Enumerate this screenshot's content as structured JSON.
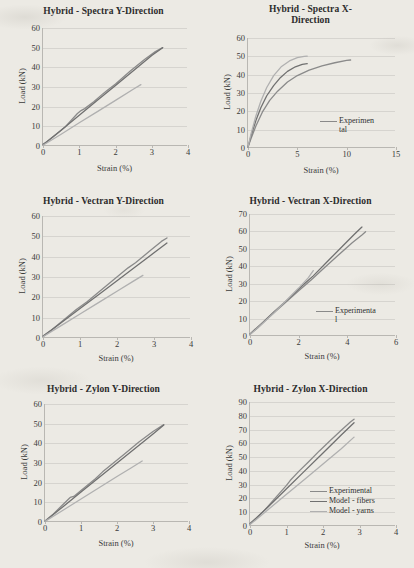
{
  "figure": {
    "background_color": "#eceae4",
    "series_colors": {
      "experimental": "#8a8a8a",
      "model_fibers": "#707070",
      "model_yarns": "#b0b0b0"
    }
  },
  "chart_data": [
    {
      "id": "spectra-y",
      "type": "line",
      "title": "Hybrid - Spectra Y-Direction",
      "xlabel": "Strain (%)",
      "ylabel": "Load (kN)",
      "xlim": [
        0,
        4
      ],
      "ylim": [
        0,
        60
      ],
      "xticks": [
        0,
        1,
        2,
        3,
        4
      ],
      "yticks": [
        0,
        10,
        20,
        30,
        40,
        50,
        60
      ],
      "grid": true,
      "legend": null,
      "series": [
        {
          "name": "Experimental",
          "color": "#8a8a8a",
          "x": [
            0,
            0.1,
            0.3,
            0.6,
            0.95,
            1.05,
            1.15,
            1.4,
            1.65,
            1.75,
            2.0,
            2.4,
            2.8,
            3.1,
            3.3
          ],
          "y": [
            1.0,
            2.0,
            5.0,
            9.5,
            16.5,
            18.0,
            19.0,
            22.5,
            26.5,
            28.0,
            31.5,
            38.0,
            44.0,
            48.0,
            50.0
          ]
        },
        {
          "name": "Model - fibers",
          "color": "#707070",
          "x": [
            0,
            0.5,
            1.0,
            1.5,
            2.0,
            2.5,
            3.0,
            3.3
          ],
          "y": [
            0.6,
            8.0,
            15.6,
            23.2,
            30.8,
            38.4,
            46.0,
            50.0
          ]
        },
        {
          "name": "Model - yarns",
          "color": "#b0b0b0",
          "x": [
            0,
            0.5,
            1.0,
            1.5,
            2.0,
            2.5,
            2.7
          ],
          "y": [
            0.4,
            6.0,
            11.8,
            17.5,
            23.2,
            29.0,
            31.2
          ]
        }
      ]
    },
    {
      "id": "spectra-x",
      "type": "line",
      "title_lines": [
        "Hybrid - Spectra X-",
        "Direction"
      ],
      "title": "Hybrid - Spectra X-Direction",
      "xlabel": "Strain (%)",
      "ylabel": "Load (kN)",
      "xlim": [
        0,
        15
      ],
      "ylim": [
        0,
        60
      ],
      "xticks": [
        0,
        5,
        10,
        15
      ],
      "yticks": [
        0,
        10,
        20,
        30,
        40,
        50,
        60
      ],
      "grid": true,
      "legend": {
        "position": "inside-lower-right",
        "entries": [
          {
            "label": "Experimental",
            "label_lines": [
              "Experimen",
              "tal"
            ],
            "color": "#8a8a8a"
          }
        ]
      },
      "series": [
        {
          "name": "Experimental",
          "color": "#8a8a8a",
          "x": [
            0,
            0.3,
            0.8,
            1.5,
            2.2,
            3.0,
            4.0,
            5.0,
            6.2,
            7.5,
            8.8,
            10.0,
            10.4
          ],
          "y": [
            0.5,
            5.0,
            12.0,
            20.0,
            26.0,
            31.0,
            36.0,
            39.5,
            42.5,
            44.8,
            46.5,
            47.8,
            48.0
          ]
        },
        {
          "name": "Model - fibers",
          "color": "#707070",
          "x": [
            0,
            0.3,
            0.8,
            1.3,
            1.9,
            2.6,
            3.3,
            4.0,
            4.8,
            5.5,
            6.0
          ],
          "y": [
            0.5,
            6.5,
            15.0,
            22.0,
            28.5,
            34.0,
            38.5,
            41.8,
            44.3,
            45.6,
            46.0
          ]
        },
        {
          "name": "Model - yarns",
          "color": "#b0b0b0",
          "x": [
            0,
            0.3,
            0.8,
            1.3,
            1.9,
            2.6,
            3.4,
            4.2,
            5.0,
            5.7,
            6.0
          ],
          "y": [
            0.5,
            7.5,
            17.5,
            25.5,
            33.0,
            39.5,
            44.5,
            47.5,
            49.3,
            50.0,
            50.1
          ]
        }
      ]
    },
    {
      "id": "vectran-y",
      "type": "line",
      "title": "Hybrid - Vectran Y-Direction",
      "xlabel": "Strain (%)",
      "ylabel": "Load (kN)",
      "xlim": [
        0,
        4
      ],
      "ylim": [
        0,
        60
      ],
      "xticks": [
        0,
        1,
        2,
        3,
        4
      ],
      "yticks": [
        0,
        10,
        20,
        30,
        40,
        50,
        60
      ],
      "grid": true,
      "legend": null,
      "series": [
        {
          "name": "Experimental",
          "color": "#8a8a8a",
          "x": [
            0,
            0.2,
            0.5,
            0.9,
            1.05,
            1.2,
            1.5,
            1.9,
            2.3,
            2.5,
            2.9,
            3.2,
            3.35
          ],
          "y": [
            1.0,
            3.5,
            8.0,
            14.0,
            16.0,
            18.0,
            22.5,
            28.5,
            34.5,
            37.0,
            43.0,
            47.5,
            49.2
          ]
        },
        {
          "name": "Model - fibers",
          "color": "#707070",
          "x": [
            0,
            0.5,
            1.0,
            1.5,
            2.0,
            2.5,
            3.0,
            3.35
          ],
          "y": [
            0.8,
            7.6,
            14.5,
            21.3,
            28.2,
            35.0,
            41.9,
            46.7
          ]
        },
        {
          "name": "Model - yarns",
          "color": "#b0b0b0",
          "x": [
            0,
            0.5,
            1.0,
            1.5,
            2.0,
            2.4,
            2.7
          ],
          "y": [
            0.6,
            6.2,
            11.8,
            17.4,
            23.0,
            27.5,
            30.8
          ]
        }
      ]
    },
    {
      "id": "vectran-x",
      "type": "line",
      "title": "Hybrid - Vectran X-Direction",
      "xlabel": "Strain (%)",
      "ylabel": "Load (kN)",
      "xlim": [
        0,
        6
      ],
      "ylim": [
        0,
        70
      ],
      "xticks": [
        0,
        2,
        4,
        6
      ],
      "yticks": [
        0,
        10,
        20,
        30,
        40,
        50,
        60,
        70
      ],
      "grid": true,
      "legend": {
        "position": "inside-lower-right",
        "entries": [
          {
            "label": "Experimental",
            "label_lines": [
              "Experimenta",
              "l"
            ],
            "color": "#8a8a8a"
          }
        ]
      },
      "series": [
        {
          "name": "Experimental",
          "color": "#8a8a8a",
          "x": [
            0,
            0.3,
            0.8,
            1.4,
            2.0,
            2.5,
            3.0,
            3.6,
            4.2,
            4.6,
            4.75
          ],
          "y": [
            1.0,
            4.5,
            11.0,
            18.5,
            26.0,
            32.0,
            38.5,
            46.0,
            53.5,
            58.0,
            59.8
          ]
        },
        {
          "name": "Model - fibers",
          "color": "#707070",
          "x": [
            0,
            0.5,
            1.0,
            1.6,
            2.2,
            2.6,
            3.2,
            3.8,
            4.3,
            4.6
          ],
          "y": [
            1.2,
            7.5,
            14.0,
            21.5,
            29.5,
            34.5,
            43.0,
            51.5,
            58.5,
            62.5
          ]
        },
        {
          "name": "Model - yarns",
          "color": "#b0b0b0",
          "x": [
            0,
            0.5,
            1.0,
            1.5,
            2.0,
            2.4,
            2.6
          ],
          "y": [
            0.8,
            7.0,
            13.5,
            20.5,
            27.5,
            33.5,
            37.5
          ]
        }
      ]
    },
    {
      "id": "zylon-y",
      "type": "line",
      "title": "Hybrid - Zylon Y-Direction",
      "xlabel": "Strain (%)",
      "ylabel": "Load (kN)",
      "xlim": [
        0,
        4
      ],
      "ylim": [
        0,
        60
      ],
      "xticks": [
        0,
        1,
        2,
        3,
        4
      ],
      "yticks": [
        0,
        10,
        20,
        30,
        40,
        50,
        60
      ],
      "grid": true,
      "legend": null,
      "series": [
        {
          "name": "Experimental",
          "color": "#8a8a8a",
          "x": [
            0,
            0.2,
            0.45,
            0.7,
            0.8,
            1.0,
            1.4,
            1.6,
            1.9,
            2.2,
            2.6,
            3.0,
            3.3
          ],
          "y": [
            0.5,
            3.5,
            8.0,
            12.5,
            13.0,
            16.0,
            22.0,
            25.5,
            30.0,
            34.5,
            40.5,
            46.0,
            49.5
          ]
        },
        {
          "name": "Model - fibers",
          "color": "#707070",
          "x": [
            0,
            0.5,
            1.0,
            1.5,
            2.0,
            2.5,
            3.0,
            3.3
          ],
          "y": [
            0.4,
            7.8,
            15.2,
            22.6,
            30.0,
            37.4,
            44.8,
            49.3
          ]
        },
        {
          "name": "Model - yarns",
          "color": "#b0b0b0",
          "x": [
            0,
            0.5,
            1.0,
            1.5,
            2.0,
            2.4,
            2.7
          ],
          "y": [
            0.3,
            6.0,
            11.7,
            17.4,
            23.1,
            27.6,
            31.0
          ]
        }
      ]
    },
    {
      "id": "zylon-x",
      "type": "line",
      "title": "Hybrid - Zylon X-Direction",
      "xlabel": "Strain (%)",
      "ylabel": "Load (kN)",
      "xlim": [
        0,
        4
      ],
      "ylim": [
        0,
        90
      ],
      "xticks": [
        0,
        1,
        2,
        3,
        4
      ],
      "yticks": [
        0,
        10,
        20,
        30,
        40,
        50,
        60,
        70,
        80,
        90
      ],
      "grid": true,
      "legend": {
        "position": "inside-lower-right",
        "entries": [
          {
            "label": "Experimental",
            "color": "#8a8a8a"
          },
          {
            "label": "Model - fibers",
            "color": "#707070"
          },
          {
            "label": "Model - yarns",
            "color": "#b0b0b0"
          }
        ]
      },
      "series": [
        {
          "name": "Experimental",
          "color": "#8a8a8a",
          "x": [
            0,
            0.15,
            0.4,
            0.75,
            1.0,
            1.1,
            1.35,
            1.6,
            1.9,
            2.2,
            2.5,
            2.75,
            2.85
          ],
          "y": [
            2.0,
            5.0,
            11.5,
            22.0,
            29.5,
            33.0,
            40.0,
            46.5,
            54.5,
            62.0,
            69.5,
            75.5,
            77.5
          ]
        },
        {
          "name": "Model - fibers",
          "color": "#707070",
          "x": [
            0,
            0.5,
            1.0,
            1.5,
            2.0,
            2.5,
            2.85
          ],
          "y": [
            1.5,
            14.0,
            27.0,
            40.0,
            53.0,
            66.0,
            75.0
          ]
        },
        {
          "name": "Model - yarns",
          "color": "#b0b0b0",
          "x": [
            0,
            0.5,
            1.0,
            1.5,
            2.0,
            2.5,
            2.85
          ],
          "y": [
            1.0,
            12.0,
            23.0,
            34.0,
            45.0,
            56.0,
            64.5
          ]
        }
      ]
    }
  ]
}
